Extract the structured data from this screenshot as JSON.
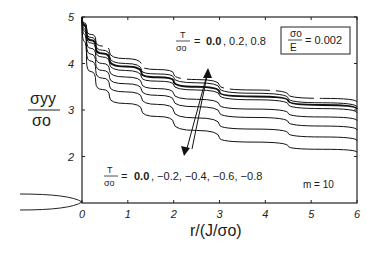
{
  "chart_data": {
    "type": "line",
    "title": "",
    "xlabel": "r/(J/σo)",
    "ylabel": "σyy/σo",
    "xlim": [
      0,
      6
    ],
    "ylim": [
      1,
      5
    ],
    "xticks": [
      "0",
      "1",
      "2",
      "3",
      "4",
      "5",
      "6"
    ],
    "yticks": [
      "2",
      "3",
      "4",
      "5"
    ],
    "grid": false,
    "x": [
      0,
      0.1,
      0.3,
      0.6,
      1.3,
      2,
      3,
      4.5,
      6
    ],
    "series": [
      {
        "name": "T/σo = 0.8",
        "style": "dashed",
        "values": [
          5.0,
          4.75,
          4.5,
          4.25,
          3.96,
          3.78,
          3.53,
          3.33,
          3.17
        ]
      },
      {
        "name": "T/σo = 0.2",
        "style": "solid",
        "values": [
          5.0,
          4.7,
          4.42,
          4.15,
          3.85,
          3.7,
          3.47,
          3.25,
          3.06
        ]
      },
      {
        "name": "T/σo = 0.0",
        "style": "bold",
        "values": [
          5.0,
          4.65,
          4.35,
          4.08,
          3.79,
          3.62,
          3.38,
          3.2,
          3.02
        ]
      },
      {
        "name": "T/σo = 0.0 (ref)",
        "style": "solid",
        "values": [
          5.0,
          4.6,
          4.28,
          4.0,
          3.7,
          3.54,
          3.32,
          3.12,
          2.94
        ]
      },
      {
        "name": "T/σo = -0.2",
        "style": "solid",
        "values": [
          5.0,
          4.5,
          4.15,
          3.85,
          3.57,
          3.35,
          3.11,
          2.93,
          2.77
        ]
      },
      {
        "name": "T/σo = -0.4",
        "style": "solid",
        "values": [
          5.0,
          4.4,
          4.0,
          3.7,
          3.43,
          3.2,
          2.94,
          2.74,
          2.57
        ]
      },
      {
        "name": "T/σo = -0.6",
        "style": "solid",
        "values": [
          5.0,
          4.25,
          3.85,
          3.52,
          3.26,
          2.98,
          2.68,
          2.5,
          2.34
        ]
      },
      {
        "name": "T/σo = -0.8",
        "style": "solid",
        "values": [
          4.9,
          4.05,
          3.6,
          3.28,
          3.0,
          2.72,
          2.4,
          2.22,
          2.09
        ]
      }
    ],
    "annotations": [
      {
        "text": "σo/E = 0.002",
        "boxed": true
      },
      {
        "text": "T/σo = 0.0, 0.2, 0.8",
        "arrow": "up"
      },
      {
        "text": "T/σo = 0.0, −0.2, −0.4, −0.6, −0.8",
        "arrow": "down"
      },
      {
        "text": "m = 10"
      }
    ]
  },
  "labels": {
    "ylabel_num": "σyy",
    "ylabel_den": "σo",
    "xlabel": "r/(J/σo)",
    "box_num": "σo",
    "box_den": "E",
    "box_val": "= 0.002",
    "upper_frac_num": "T",
    "upper_frac_den": "σo",
    "upper_eq": "=",
    "upper_bold": "0.0",
    "upper_rest": ", 0.2, 0.8",
    "lower_frac_num": "T",
    "lower_frac_den": "σo",
    "lower_eq": "=",
    "lower_bold": "0.0",
    "lower_rest": ", −0.2, −0.4, −0.6, −0.8",
    "m_label": "m = 10"
  },
  "ticks": {
    "x": [
      "0",
      "1",
      "2",
      "3",
      "4",
      "5",
      "6"
    ],
    "y": [
      "2",
      "3",
      "4",
      "5"
    ]
  }
}
